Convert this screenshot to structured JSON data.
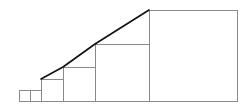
{
  "diagram": {
    "type": "fibonacci-squares",
    "sequence": [
      1,
      1,
      2,
      3,
      5,
      8
    ],
    "colors": {
      "square_stroke": "#8a8a8a",
      "diagonal_stroke": "#111111",
      "background": "#ffffff"
    },
    "squares": [
      {
        "size": 1,
        "x": 19,
        "y": 90,
        "w": 11,
        "h": 11
      },
      {
        "size": 1,
        "x": 30,
        "y": 90,
        "w": 11,
        "h": 11
      },
      {
        "size": 2,
        "x": 41,
        "y": 79,
        "w": 22,
        "h": 22
      },
      {
        "size": 3,
        "x": 63,
        "y": 67,
        "w": 32,
        "h": 34
      },
      {
        "size": 5,
        "x": 95,
        "y": 44,
        "w": 54,
        "h": 57
      },
      {
        "size": 8,
        "x": 149,
        "y": 10,
        "w": 88,
        "h": 91
      }
    ],
    "diagonal_points": "41,79 63,67 95,44 149,10"
  }
}
